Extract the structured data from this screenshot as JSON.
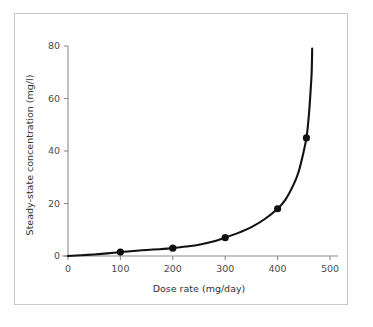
{
  "figure": {
    "background_color": "#ffffff",
    "frame_color": "#c9c9c9",
    "axis_color": "#8c8c8c",
    "curve_color": "#111111",
    "marker_color": "#111111"
  },
  "chart_data": {
    "type": "line",
    "title": "",
    "subtitle": "",
    "xlabel": "Dose rate (mg/day)",
    "ylabel": "Steady-state concentration (mg/l)",
    "xlim": [
      0,
      500
    ],
    "ylim": [
      0,
      80
    ],
    "xticks": [
      0,
      100,
      200,
      300,
      400,
      500
    ],
    "xtick_labels": [
      "0",
      "100",
      "200",
      "300",
      "400",
      "500"
    ],
    "yticks": [
      0,
      20,
      40,
      60,
      80
    ],
    "ytick_labels": [
      "0",
      "20",
      "40",
      "60",
      "80"
    ],
    "grid": false,
    "legend": null,
    "legend_position": "none",
    "annotations": [],
    "series": [
      {
        "name": "Steady-state concentration vs dose rate",
        "marker": "filled-circle",
        "line_style": "solid",
        "color": "#111111",
        "points": [
          {
            "x": 100,
            "y": 1.5
          },
          {
            "x": 200,
            "y": 3.0
          },
          {
            "x": 300,
            "y": 7.0
          },
          {
            "x": 400,
            "y": 18.0
          },
          {
            "x": 455,
            "y": 45.0
          }
        ],
        "curve": [
          {
            "x": 0,
            "y": 0.0
          },
          {
            "x": 25,
            "y": 0.3
          },
          {
            "x": 50,
            "y": 0.6
          },
          {
            "x": 75,
            "y": 1.0
          },
          {
            "x": 100,
            "y": 1.5
          },
          {
            "x": 125,
            "y": 1.9
          },
          {
            "x": 150,
            "y": 2.3
          },
          {
            "x": 175,
            "y": 2.6
          },
          {
            "x": 200,
            "y": 3.0
          },
          {
            "x": 225,
            "y": 3.6
          },
          {
            "x": 250,
            "y": 4.3
          },
          {
            "x": 275,
            "y": 5.4
          },
          {
            "x": 300,
            "y": 7.0
          },
          {
            "x": 325,
            "y": 8.8
          },
          {
            "x": 350,
            "y": 11.0
          },
          {
            "x": 375,
            "y": 14.0
          },
          {
            "x": 400,
            "y": 18.0
          },
          {
            "x": 415,
            "y": 21.5
          },
          {
            "x": 430,
            "y": 27.0
          },
          {
            "x": 440,
            "y": 32.0
          },
          {
            "x": 450,
            "y": 40.0
          },
          {
            "x": 455,
            "y": 45.0
          },
          {
            "x": 458,
            "y": 50.0
          },
          {
            "x": 461,
            "y": 57.0
          },
          {
            "x": 463,
            "y": 63.0
          },
          {
            "x": 465,
            "y": 70.0
          },
          {
            "x": 466,
            "y": 79.0
          }
        ],
        "asymptote_x": 470
      }
    ]
  }
}
